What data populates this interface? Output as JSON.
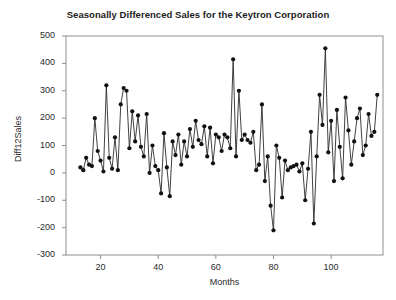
{
  "chart_data": {
    "type": "line",
    "title": "Seasonally Differenced Sales for the Keytron Corporation",
    "xlabel": "Months",
    "ylabel": "Diff12Sales",
    "grid": false,
    "legend": null,
    "marker": "filled-circle",
    "line_color": "#222222",
    "marker_color": "#111111",
    "xlim": [
      8,
      118
    ],
    "ylim": [
      -300,
      500
    ],
    "xticks": [
      20,
      40,
      60,
      80,
      100
    ],
    "yticks": [
      -300,
      -200,
      -100,
      0,
      100,
      200,
      300,
      400,
      500
    ],
    "series_name": "Diff12Sales",
    "x": [
      13,
      14,
      15,
      16,
      17,
      18,
      19,
      20,
      21,
      22,
      23,
      24,
      25,
      26,
      27,
      28,
      29,
      30,
      31,
      32,
      33,
      34,
      35,
      36,
      37,
      38,
      39,
      40,
      41,
      42,
      43,
      44,
      45,
      46,
      47,
      48,
      49,
      50,
      51,
      52,
      53,
      54,
      55,
      56,
      57,
      58,
      59,
      60,
      61,
      62,
      63,
      64,
      65,
      66,
      67,
      68,
      69,
      70,
      71,
      72,
      73,
      74,
      75,
      76,
      77,
      78,
      79,
      80,
      81,
      82,
      83,
      84,
      85,
      86,
      87,
      88,
      89,
      90,
      91,
      92,
      93,
      94,
      95,
      96,
      97,
      98,
      99,
      100,
      101,
      102,
      103,
      104,
      105,
      106,
      107,
      108,
      109,
      110,
      111,
      112,
      113,
      114,
      115,
      116
    ],
    "y": [
      20,
      10,
      55,
      30,
      25,
      200,
      80,
      45,
      5,
      320,
      55,
      15,
      130,
      10,
      250,
      310,
      300,
      90,
      225,
      115,
      210,
      95,
      60,
      215,
      0,
      100,
      25,
      10,
      -75,
      145,
      20,
      -85,
      115,
      65,
      140,
      30,
      115,
      60,
      160,
      95,
      190,
      120,
      105,
      170,
      60,
      165,
      35,
      140,
      130,
      80,
      140,
      130,
      90,
      415,
      60,
      300,
      120,
      140,
      120,
      110,
      150,
      10,
      30,
      250,
      -30,
      60,
      -120,
      -210,
      100,
      55,
      -90,
      45,
      10,
      20,
      25,
      30,
      5,
      35,
      -100,
      15,
      150,
      -185,
      60,
      285,
      175,
      455,
      75,
      190,
      -30,
      230,
      95,
      -20,
      275,
      155,
      30,
      115,
      200,
      235,
      65,
      100,
      215,
      135,
      150,
      285
    ]
  }
}
